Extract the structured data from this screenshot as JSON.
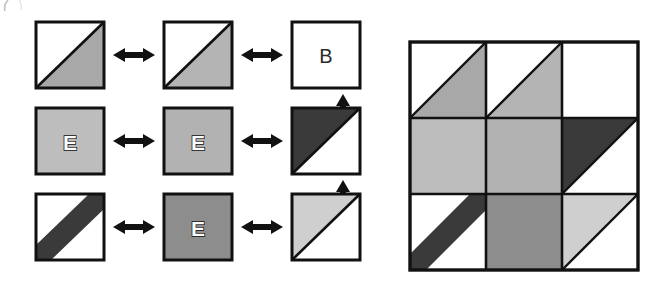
{
  "figure": {
    "background_color": "#ffffff",
    "outline_color": "#111111",
    "artifact_top_left": "(",
    "palette": {
      "white": "#ffffff",
      "light_gray": "#cfcfcf",
      "medium_gray": "#a8a8a8",
      "mid_gray": "#9a9a9a",
      "dark_gray": "#7d7d7d",
      "near_black": "#3a3a3a",
      "black": "#111111"
    }
  },
  "left_panel": {
    "name": "tile-source-grid",
    "rows": 3,
    "cols": 3,
    "tiles": [
      {
        "id": "tile-r0c0",
        "row": 0,
        "col": 0,
        "pattern": "diagonal-half",
        "diagonal": "bottom-left-to-top-right",
        "fill_upper_left": "#ffffff",
        "fill_lower_right": "#a8a8a8",
        "label": ""
      },
      {
        "id": "tile-r0c1",
        "row": 0,
        "col": 1,
        "pattern": "diagonal-half",
        "diagonal": "bottom-left-to-top-right",
        "fill_upper_left": "#ffffff",
        "fill_lower_right": "#b4b4b4",
        "label": ""
      },
      {
        "id": "tile-r0c2",
        "row": 0,
        "col": 2,
        "pattern": "solid",
        "fill": "#ffffff",
        "label": "B",
        "label_style": "plain"
      },
      {
        "id": "tile-r1c0",
        "row": 1,
        "col": 0,
        "pattern": "solid",
        "fill": "#bdbdbd",
        "label": "E",
        "label_style": "outlined"
      },
      {
        "id": "tile-r1c1",
        "row": 1,
        "col": 1,
        "pattern": "solid",
        "fill": "#b2b2b2",
        "label": "E",
        "label_style": "outlined"
      },
      {
        "id": "tile-r1c2",
        "row": 1,
        "col": 2,
        "pattern": "diagonal-half",
        "diagonal": "bottom-left-to-top-right",
        "fill_upper_left": "#3a3a3a",
        "fill_lower_right": "#ffffff",
        "label": ""
      },
      {
        "id": "tile-r2c0",
        "row": 2,
        "col": 0,
        "pattern": "diagonal-band",
        "diagonal": "bottom-left-to-top-right",
        "fill_background": "#ffffff",
        "fill_band": "#3a3a3a",
        "label": ""
      },
      {
        "id": "tile-r2c1",
        "row": 2,
        "col": 1,
        "pattern": "solid",
        "fill": "#8d8d8d",
        "label": "E",
        "label_style": "outlined"
      },
      {
        "id": "tile-r2c2",
        "row": 2,
        "col": 2,
        "pattern": "diagonal-half",
        "diagonal": "bottom-left-to-top-right",
        "fill_upper_left": "#cfcfcf",
        "fill_lower_right": "#ffffff",
        "label": ""
      }
    ],
    "horizontal_arrows": [
      {
        "id": "arrow-h-r0c0-r0c1",
        "row": 0,
        "between": [
          0,
          1
        ],
        "type": "double-headed-horizontal"
      },
      {
        "id": "arrow-h-r0c1-r0c2",
        "row": 0,
        "between": [
          1,
          2
        ],
        "type": "double-headed-horizontal"
      },
      {
        "id": "arrow-h-r1c0-r1c1",
        "row": 1,
        "between": [
          0,
          1
        ],
        "type": "double-headed-horizontal"
      },
      {
        "id": "arrow-h-r1c1-r1c2",
        "row": 1,
        "between": [
          1,
          2
        ],
        "type": "double-headed-horizontal"
      },
      {
        "id": "arrow-h-r2c0-r2c1",
        "row": 2,
        "between": [
          0,
          1
        ],
        "type": "double-headed-horizontal"
      },
      {
        "id": "arrow-h-r2c1-r2c2",
        "row": 2,
        "between": [
          1,
          2
        ],
        "type": "double-headed-horizontal"
      }
    ],
    "vertical_arrows": [
      {
        "id": "arrow-v-r0-r1",
        "between": [
          0,
          1
        ],
        "type": "double-headed-vertical"
      },
      {
        "id": "arrow-v-r1-r2",
        "between": [
          1,
          2
        ],
        "type": "double-headed-vertical"
      }
    ]
  },
  "right_panel": {
    "name": "assembled-composite-grid",
    "rows": 3,
    "cols": 3,
    "border_color": "#111111",
    "tiles": [
      {
        "id": "composite-r0c0",
        "row": 0,
        "col": 0,
        "pattern": "diagonal-half",
        "diagonal": "bottom-left-to-top-right",
        "fill_upper_left": "#ffffff",
        "fill_lower_right": "#a8a8a8"
      },
      {
        "id": "composite-r0c1",
        "row": 0,
        "col": 1,
        "pattern": "diagonal-half",
        "diagonal": "bottom-left-to-top-right",
        "fill_upper_left": "#ffffff",
        "fill_lower_right": "#b4b4b4"
      },
      {
        "id": "composite-r0c2",
        "row": 0,
        "col": 2,
        "pattern": "solid",
        "fill": "#ffffff"
      },
      {
        "id": "composite-r1c0",
        "row": 1,
        "col": 0,
        "pattern": "solid",
        "fill": "#bdbdbd"
      },
      {
        "id": "composite-r1c1",
        "row": 1,
        "col": 1,
        "pattern": "solid",
        "fill": "#b2b2b2"
      },
      {
        "id": "composite-r1c2",
        "row": 1,
        "col": 2,
        "pattern": "diagonal-half",
        "diagonal": "bottom-left-to-top-right",
        "fill_upper_left": "#3a3a3a",
        "fill_lower_right": "#ffffff"
      },
      {
        "id": "composite-r2c0",
        "row": 2,
        "col": 0,
        "pattern": "diagonal-band",
        "diagonal": "bottom-left-to-top-right",
        "fill_background": "#ffffff",
        "fill_band": "#3a3a3a"
      },
      {
        "id": "composite-r2c1",
        "row": 2,
        "col": 1,
        "pattern": "solid",
        "fill": "#8d8d8d"
      },
      {
        "id": "composite-r2c2",
        "row": 2,
        "col": 2,
        "pattern": "diagonal-half",
        "diagonal": "bottom-left-to-top-right",
        "fill_upper_left": "#cfcfcf",
        "fill_lower_right": "#ffffff"
      }
    ]
  }
}
